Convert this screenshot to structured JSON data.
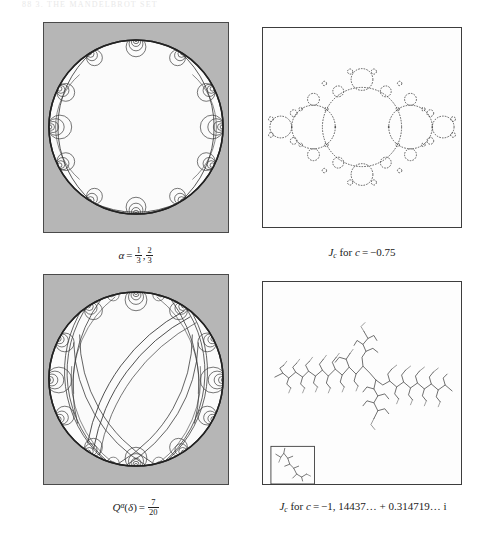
{
  "page": {
    "running_head": "88        3. THE MANDELBROT SET",
    "background": "#ffffff",
    "width": 484,
    "height": 538
  },
  "figure": {
    "layout": "2x2 grid: laminations of the disk (left column) paired with Julia sets (right column)",
    "panel_background_lamination": "#b6b6b6",
    "panel_background_julia": "#fdfdfd",
    "stroke_color": "#333333"
  },
  "panels": [
    {
      "id": "lamination-top-left",
      "kind": "lamination",
      "caption_parts": {
        "alpha": "α",
        "equals": "=",
        "frac1_num": "1",
        "frac1_den": "3",
        "comma": ",",
        "frac2_num": "2",
        "frac2_den": "3"
      },
      "caption_plain": "α = 1/3, 2/3",
      "description": "Unit disk with three main geodesic leaves and nested tangent-circle spirals accumulating on the boundary circle.",
      "geometry": {
        "cx": 93,
        "cy": 105,
        "r": 88,
        "major_leaves": 3,
        "spiral_nests": 12
      }
    },
    {
      "id": "julia-top-right",
      "kind": "julia",
      "caption_parts": {
        "J": "J",
        "J_sub": "c",
        "for": "for",
        "c": "c",
        "equals": "=",
        "value": "−0.75"
      },
      "caption_plain": "J_c for c = −0.75",
      "description": "Julia set at the root of the period-2 component: a chain of tangent circular lobes along the real axis with decorations.",
      "chain_lobe_radii": [
        42,
        23,
        12,
        6
      ],
      "parameter_c": -0.75
    },
    {
      "id": "lamination-bottom-left",
      "kind": "lamination",
      "caption_parts": {
        "Q": "Q",
        "Q_sup": "α",
        "paren_open": "(",
        "delta": "δ",
        "paren_close": ")",
        "equals": "=",
        "frac_num": "7",
        "frac_den": "20"
      },
      "caption_plain": "Q^α(δ) = 7/20",
      "description": "Denser lamination of the unit disk: many long geodesics crossing the interior plus nested spiral families at the boundary.",
      "geometry": {
        "cx": 93,
        "cy": 105,
        "r": 88,
        "major_leaves": 9,
        "spiral_nests": 14
      }
    },
    {
      "id": "julia-bottom-right",
      "kind": "julia",
      "caption_parts": {
        "J": "J",
        "J_sub": "c",
        "for": "for",
        "c": "c",
        "equals": "=",
        "value": "−1, 14437… + 0.314719… i"
      },
      "caption_plain": "J_c for c = −1, 14437… + 0.314719… i",
      "description": "Dendrite Julia set: a thin branched tree with no interior, spanning the frame horizontally; a magnified inset box sits in the lower-left corner.",
      "parameter_c_real": "-1,14437...",
      "parameter_c_imag": "+0.314719... i",
      "inset": {
        "present": true,
        "x": 8,
        "y": 176,
        "width": 44,
        "height": 38,
        "content": "zoomed branch of the dendrite"
      }
    }
  ]
}
